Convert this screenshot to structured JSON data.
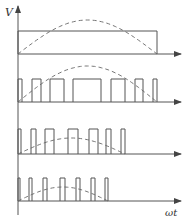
{
  "axis_labels": {
    "y": "V",
    "x": "ωt"
  },
  "colors": {
    "line": "#555555",
    "dash": "#666666",
    "background": "#ffffff"
  },
  "rows": [
    {
      "name": "single-pulse",
      "baseline": 54,
      "top": 31,
      "sine_start": 18,
      "sine_end": 157,
      "sine_peak": 20,
      "pulses": [
        [
          18,
          157
        ]
      ]
    },
    {
      "name": "pwm-7-pulse-wide",
      "baseline": 102,
      "top": 79,
      "sine_start": 18,
      "sine_end": 157,
      "sine_peak": 66,
      "pulses": [
        [
          18,
          22
        ],
        [
          32,
          41
        ],
        [
          50,
          64
        ],
        [
          73,
          101
        ],
        [
          111,
          125
        ],
        [
          135,
          143
        ],
        [
          153,
          157
        ]
      ]
    },
    {
      "name": "pwm-7-pulse-medium",
      "baseline": 154,
      "top": 129,
      "sine_start": 18,
      "sine_end": 125,
      "sine_peak": 130,
      "pulses": [
        [
          18,
          21
        ],
        [
          31,
          36
        ],
        [
          45,
          54
        ],
        [
          68,
          78
        ],
        [
          89,
          98
        ],
        [
          106,
          111
        ],
        [
          121,
          125
        ]
      ]
    },
    {
      "name": "pwm-7-pulse-narrow",
      "baseline": 201,
      "top": 178,
      "sine_start": 18,
      "sine_end": 108,
      "sine_peak": 183,
      "pulses": [
        [
          18,
          20
        ],
        [
          29,
          32
        ],
        [
          43,
          47
        ],
        [
          60,
          65
        ],
        [
          76,
          80
        ],
        [
          91,
          95
        ],
        [
          105,
          108
        ]
      ]
    }
  ]
}
